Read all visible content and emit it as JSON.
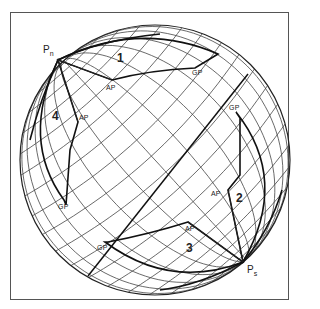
{
  "figure": {
    "type": "celestial sphere diagram",
    "frame": {
      "x": 10,
      "y": 12,
      "w": 279,
      "h": 288
    },
    "sphere": {
      "cx": 155,
      "cy": 160,
      "r": 135
    },
    "poles": [
      {
        "id": "north",
        "label": "P",
        "sub": "n",
        "x": 58,
        "y": 60
      },
      {
        "id": "south",
        "label": "P",
        "sub": "s",
        "x": 243,
        "y": 262
      }
    ],
    "regions": [
      {
        "label": "1",
        "x": 120,
        "y": 56
      },
      {
        "label": "2",
        "x": 236,
        "y": 196
      },
      {
        "label": "3",
        "x": 185,
        "y": 246
      },
      {
        "label": "4",
        "x": 52,
        "y": 115
      }
    ],
    "point_labels": [
      {
        "text": "AP",
        "x": 110,
        "y": 83
      },
      {
        "text": "GP",
        "x": 193,
        "y": 69
      },
      {
        "text": "AP",
        "x": 76,
        "y": 117
      },
      {
        "text": "GP",
        "x": 59,
        "y": 204
      },
      {
        "text": "GP",
        "x": 230,
        "y": 105
      },
      {
        "text": "AP",
        "x": 212,
        "y": 191
      },
      {
        "text": "AP",
        "x": 184,
        "y": 226
      },
      {
        "text": "GP",
        "x": 97,
        "y": 245
      }
    ],
    "colors": {
      "line": "#222222",
      "grid": "#444444",
      "background": "#ffffff"
    }
  }
}
